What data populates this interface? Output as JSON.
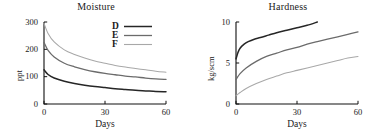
{
  "figure": {
    "background": "#ffffff",
    "panels": [
      "moisture",
      "hardness"
    ]
  },
  "legend": {
    "position": "top-right-inside-left-panel",
    "entries": [
      {
        "key": "D",
        "color": "#262626",
        "width": 1.5
      },
      {
        "key": "E",
        "color": "#6b6b6b",
        "width": 1.3
      },
      {
        "key": "F",
        "color": "#a8a8a8",
        "width": 1.1
      }
    ]
  },
  "chart_data": [
    {
      "type": "line",
      "title": "Moisture",
      "xlabel": "Days",
      "ylabel": "ppt",
      "xlim": [
        0,
        60
      ],
      "ylim": [
        0,
        300
      ],
      "xticks": [
        0,
        30,
        60
      ],
      "xticklabels": [
        "0",
        "30",
        "60"
      ],
      "yticks": [
        0,
        100,
        200,
        300
      ],
      "yticklabels": [
        "0",
        "100",
        "200",
        "300"
      ],
      "grid": false,
      "legend": [
        "D",
        "E",
        "F"
      ],
      "x": [
        0,
        2,
        5,
        10,
        15,
        20,
        25,
        30,
        35,
        40,
        45,
        50,
        55,
        60
      ],
      "series": [
        {
          "name": "D",
          "color": "#262626",
          "values": [
            125,
            108,
            95,
            83,
            75,
            69,
            64,
            60,
            56,
            53,
            50,
            48,
            46,
            45
          ]
        },
        {
          "name": "E",
          "color": "#6b6b6b",
          "values": [
            225,
            196,
            172,
            149,
            136,
            126,
            118,
            112,
            107,
            102,
            99,
            95,
            92,
            90
          ]
        },
        {
          "name": "F",
          "color": "#a8a8a8",
          "values": [
            295,
            258,
            227,
            198,
            181,
            168,
            157,
            149,
            141,
            135,
            130,
            125,
            120,
            116
          ]
        }
      ]
    },
    {
      "type": "line",
      "title": "Hardness",
      "xlabel": "Days",
      "ylabel": "kg/scm",
      "xlim": [
        0,
        60
      ],
      "ylim": [
        0,
        10
      ],
      "xticks": [
        0,
        30,
        60
      ],
      "xticklabels": [
        "0",
        "30",
        "60"
      ],
      "yticks": [
        0,
        5,
        10
      ],
      "yticklabels": [
        "0",
        "5",
        "10"
      ],
      "grid": false,
      "legend": [],
      "series": [
        {
          "name": "D",
          "color": "#262626",
          "x": [
            0,
            1,
            2,
            4,
            6,
            9,
            12,
            16,
            20,
            25,
            30,
            35,
            40
          ],
          "values": [
            5.5,
            6.3,
            6.8,
            7.3,
            7.6,
            7.9,
            8.1,
            8.4,
            8.7,
            9.0,
            9.3,
            9.6,
            10.0
          ]
        },
        {
          "name": "E",
          "color": "#6b6b6b",
          "x": [
            0,
            2,
            5,
            10,
            15,
            20,
            25,
            30,
            35,
            40,
            45,
            50,
            55,
            60
          ],
          "values": [
            3.0,
            3.7,
            4.4,
            5.2,
            5.8,
            6.2,
            6.6,
            6.9,
            7.3,
            7.6,
            7.9,
            8.2,
            8.5,
            8.8
          ]
        },
        {
          "name": "F",
          "color": "#a8a8a8",
          "x": [
            0,
            2,
            5,
            10,
            15,
            20,
            25,
            30,
            35,
            40,
            45,
            50,
            55,
            60
          ],
          "values": [
            1.0,
            1.4,
            1.9,
            2.5,
            3.0,
            3.4,
            3.8,
            4.1,
            4.4,
            4.7,
            5.0,
            5.3,
            5.6,
            5.8
          ]
        }
      ]
    }
  ]
}
